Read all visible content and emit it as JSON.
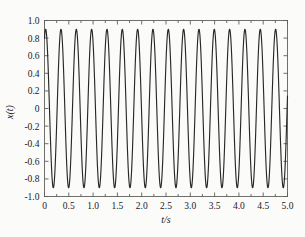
{
  "chart_data": {
    "type": "line",
    "title": "",
    "xlabel": "t/s",
    "ylabel": "x(t)",
    "xlim": [
      0,
      5
    ],
    "ylim": [
      -1.0,
      1.0
    ],
    "grid": false,
    "legend": null,
    "legend_position": "none",
    "line_color": "#28282a",
    "background_color": "#fbfbf9",
    "frame_color": "#6f6f6c",
    "xticks": [
      0,
      0.5,
      1.0,
      1.5,
      2.0,
      2.5,
      3.0,
      3.5,
      4.0,
      4.5,
      5.0
    ],
    "xtick_labels": [
      "0",
      "0.5",
      "1.0",
      "1.5",
      "2.0",
      "2.5",
      "3.0",
      "3.5",
      "4.0",
      "4.5",
      "5.0"
    ],
    "yticks": [
      -1.0,
      -0.8,
      -0.6,
      -0.4,
      -0.2,
      0,
      0.2,
      0.4,
      0.6,
      0.8,
      1.0
    ],
    "ytick_labels": [
      "-1.0",
      "-0.8",
      "-0.6",
      "-0.4",
      "-0.2",
      "0",
      "0.2",
      "0.4",
      "0.6",
      "0.8",
      "1.0"
    ],
    "minor_xtick_step": 0.25,
    "ticks_inward": true,
    "ticks_all_sides": true,
    "series": [
      {
        "name": "x(t)",
        "description": "sinusoidal oscillation, constant amplitude",
        "amplitude": 0.9,
        "frequency_hz": 3.17,
        "period_s": 0.315,
        "phase_rad": 1.1,
        "n_cycles_visible": 16,
        "sample_count": 2001,
        "x_start": 0,
        "x_end": 5,
        "y_at_x0": 0.8,
        "peak_value": 0.9,
        "trough_value": -0.9,
        "peak_times": [
          0.065,
          0.38,
          0.695,
          1.01,
          1.325,
          1.64,
          1.955,
          2.27,
          2.585,
          2.9,
          3.215,
          3.53,
          3.845,
          4.16,
          4.475,
          4.79
        ],
        "trough_times": [
          0.223,
          0.538,
          0.853,
          1.168,
          1.483,
          1.798,
          2.113,
          2.428,
          2.743,
          3.058,
          3.373,
          3.688,
          4.003,
          4.318,
          4.633,
          4.948
        ]
      }
    ]
  }
}
